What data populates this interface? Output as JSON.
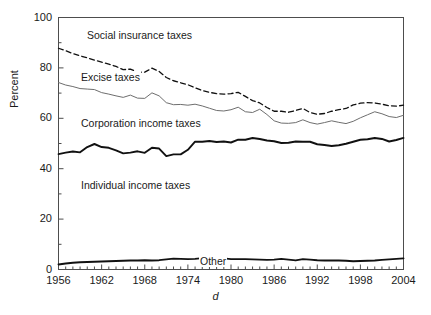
{
  "chart_data": {
    "type": "line",
    "title": "",
    "subtitle": "",
    "xlabel": "d",
    "ylabel": "Percent",
    "xlim": [
      1956,
      2004
    ],
    "ylim": [
      0,
      100
    ],
    "grid": false,
    "legend_position": "inline-annotations",
    "xticks": [
      1956,
      1962,
      1968,
      1974,
      1980,
      1986,
      1992,
      1998,
      2004
    ],
    "xticks_minor_step": 1,
    "yticks": [
      0,
      20,
      40,
      60,
      80,
      100
    ],
    "yticks_minor": [
      10,
      30,
      50,
      70,
      90
    ],
    "x": [
      1956,
      1957,
      1958,
      1959,
      1960,
      1961,
      1962,
      1963,
      1964,
      1965,
      1966,
      1967,
      1968,
      1969,
      1970,
      1971,
      1972,
      1973,
      1974,
      1975,
      1976,
      1977,
      1978,
      1979,
      1980,
      1981,
      1982,
      1983,
      1984,
      1985,
      1986,
      1987,
      1988,
      1989,
      1990,
      1991,
      1992,
      1993,
      1994,
      1995,
      1996,
      1997,
      1998,
      1999,
      2000,
      2001,
      2002,
      2003,
      2004
    ],
    "series": [
      {
        "name": "Other",
        "style": "solid-thick",
        "color": "#111111",
        "width": 1.9,
        "values": [
          2.0,
          2.4,
          2.7,
          2.9,
          3.0,
          3.1,
          3.2,
          3.3,
          3.4,
          3.5,
          3.6,
          3.6,
          3.7,
          3.6,
          3.7,
          4.0,
          4.3,
          4.2,
          4.1,
          4.2,
          4.5,
          4.6,
          4.7,
          4.4,
          4.1,
          4.1,
          4.1,
          4.0,
          3.9,
          3.8,
          3.9,
          4.2,
          3.9,
          3.6,
          4.1,
          3.9,
          3.7,
          3.6,
          3.6,
          3.6,
          3.5,
          3.3,
          3.4,
          3.5,
          3.6,
          3.8,
          4.0,
          4.2,
          4.4
        ]
      },
      {
        "name": "Individual income taxes",
        "style": "solid-thick",
        "color": "#111111",
        "width": 1.9,
        "values": [
          45.8,
          46.4,
          46.8,
          46.5,
          48.6,
          49.8,
          48.6,
          48.3,
          47.3,
          46.1,
          46.4,
          46.9,
          46.3,
          48.3,
          48.0,
          45.0,
          45.7,
          45.7,
          47.5,
          50.7,
          50.7,
          51.0,
          50.6,
          50.8,
          50.4,
          51.5,
          51.5,
          52.2,
          51.8,
          51.2,
          50.9,
          50.2,
          50.3,
          50.8,
          50.7,
          50.7,
          49.7,
          49.4,
          49.0,
          49.3,
          49.9,
          50.7,
          51.5,
          51.7,
          52.2,
          51.8,
          50.8,
          51.4,
          52.2
        ]
      },
      {
        "name": "Excise taxes",
        "style": "solid-thin",
        "color": "#6e6e6e",
        "width": 1.0,
        "values": [
          74.2,
          73.2,
          72.6,
          71.8,
          71.6,
          71.4,
          70.2,
          69.6,
          68.9,
          68.3,
          69.2,
          68.0,
          67.9,
          70.1,
          68.9,
          66.2,
          65.4,
          65.5,
          65.2,
          65.6,
          64.9,
          64.0,
          63.1,
          62.9,
          63.4,
          64.4,
          62.6,
          62.3,
          63.6,
          61.5,
          59.0,
          58.1,
          58.0,
          58.3,
          59.4,
          58.3,
          57.7,
          58.3,
          59.0,
          58.4,
          57.9,
          58.8,
          60.2,
          61.4,
          62.6,
          61.8,
          60.7,
          60.3,
          61.2
        ]
      },
      {
        "name": "Social insurance taxes",
        "style": "dashed",
        "color": "#111111",
        "width": 1.3,
        "values": [
          87.8,
          86.8,
          85.7,
          84.8,
          84.0,
          83.1,
          82.3,
          81.5,
          80.6,
          79.3,
          79.5,
          78.3,
          78.3,
          79.9,
          78.6,
          76.2,
          74.9,
          74.1,
          73.3,
          72.1,
          71.0,
          70.3,
          69.8,
          69.6,
          69.8,
          70.3,
          68.7,
          67.0,
          66.1,
          64.3,
          62.8,
          62.8,
          62.4,
          63.1,
          63.9,
          62.3,
          61.6,
          61.9,
          62.8,
          63.4,
          63.9,
          65.3,
          66.0,
          66.2,
          66.1,
          65.6,
          65.0,
          64.8,
          65.2
        ]
      }
    ],
    "annotations": [
      {
        "text": "Social insurance taxes",
        "x_px": 86,
        "y_px": 29
      },
      {
        "text": "Excise taxes",
        "x_px": 80,
        "y_px": 71
      },
      {
        "text": "Corporation income taxes",
        "x_px": 80,
        "y_px": 117
      },
      {
        "text": "Individual income taxes",
        "x_px": 80,
        "y_px": 179
      },
      {
        "text": "Other",
        "x_px": 199,
        "y_px": 255
      }
    ]
  },
  "axis": {
    "ytick_labels": [
      "100",
      "80",
      "60",
      "40",
      "20",
      "0"
    ],
    "xtick_labels": [
      "1956",
      "1962",
      "1968",
      "1974",
      "1980",
      "1986",
      "1992",
      "1998",
      "2004"
    ],
    "ylabel": "Percent",
    "xlabel": "d"
  },
  "colors": {
    "frame": "#4d4d4d",
    "text": "#1a1a1a",
    "thick_line": "#111111",
    "thin_line": "#6e6e6e",
    "background": "#ffffff"
  }
}
